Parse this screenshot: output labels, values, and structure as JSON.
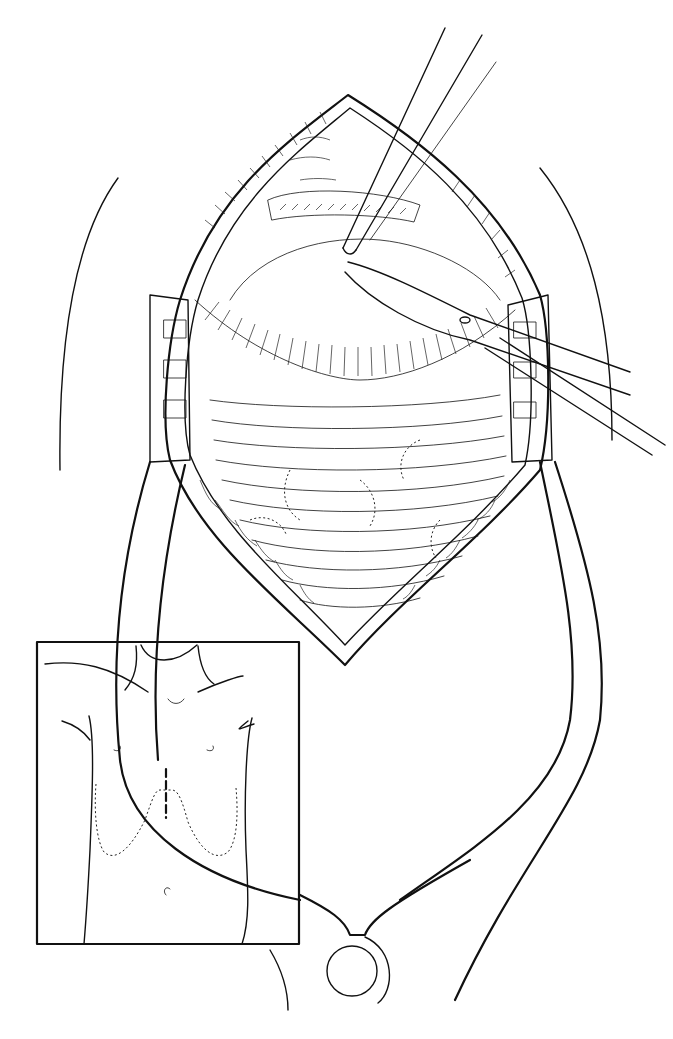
{
  "figure": {
    "kind": "surgical line illustration",
    "background_color": "#ffffff",
    "ink_color": "#111111",
    "main_view": {
      "subject": "open midline sternotomy / thoracic incision held by retractor",
      "instruments": [
        "forceps",
        "curved scissors",
        "self-retaining retractor"
      ]
    },
    "inset": {
      "subject": "torso front view with dashed incision line and dotted costal margin outline",
      "bounds": {
        "x": 37,
        "y": 642,
        "width": 262,
        "height": 300
      }
    }
  }
}
